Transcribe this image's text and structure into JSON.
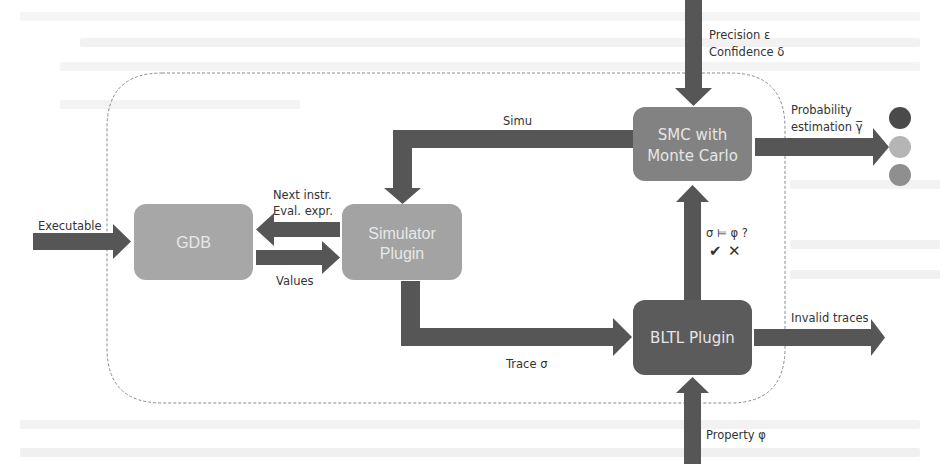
{
  "diagram": {
    "type": "architecture-flow",
    "colors": {
      "arrow": "#565656",
      "gdb_box": "#a7a7a7",
      "simulator_box": "#a3a3a3",
      "smc_box": "#828282",
      "bltl_box": "#5b5b5b",
      "container_border": "#8a8a8a",
      "dot_dark": "#4a4a4a",
      "dot_light": "#b5b5b5",
      "dot_mid": "#8f8f8f"
    },
    "nodes": {
      "gdb": {
        "label": "GDB"
      },
      "simulator": {
        "label_line1": "Simulator",
        "label_line2": "Plugin"
      },
      "smc": {
        "label_line1": "SMC with",
        "label_line2": "Monte Carlo"
      },
      "bltl": {
        "label": "BLTL Plugin"
      }
    },
    "edges": {
      "executable": {
        "label": "Executable"
      },
      "next_instr": {
        "label_line1": "Next instr.",
        "label_line2": "Eval. expr."
      },
      "values": {
        "label": "Values"
      },
      "simu": {
        "label": "Simu"
      },
      "trace": {
        "label": "Trace σ"
      },
      "precision": {
        "label_line1": "Precision ε",
        "label_line2": "Confidence δ"
      },
      "probability": {
        "label_line1": "Probability",
        "label_line2": "estimation γ̅"
      },
      "check": {
        "label": "σ ⊨ φ ?",
        "yes_mark": "✔",
        "no_mark": "✕"
      },
      "invalid": {
        "label": "Invalid traces"
      },
      "property": {
        "label": "Property φ"
      }
    },
    "result_dots": [
      "dark",
      "light",
      "mid"
    ]
  }
}
